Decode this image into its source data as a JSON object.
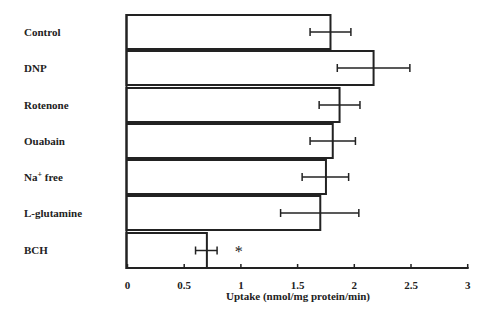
{
  "chart_data": {
    "type": "bar",
    "orientation": "horizontal",
    "title": "",
    "xlabel": "Uptake (nmol/mg protein/min)",
    "ylabel": "",
    "categories": [
      "Control",
      "DNP",
      "Rotenone",
      "Ouabain",
      "Na+ free",
      "L-glutamine",
      "BCH"
    ],
    "category_display": [
      {
        "main": "Control",
        "sup": ""
      },
      {
        "main": "DNP",
        "sup": ""
      },
      {
        "main": "Rotenone",
        "sup": ""
      },
      {
        "main": "Ouabain",
        "sup": ""
      },
      {
        "main": "Na",
        "sup": "+",
        "rest": " free"
      },
      {
        "main": "L-glutamine",
        "sup": ""
      },
      {
        "main": "BCH",
        "sup": ""
      }
    ],
    "values": [
      1.79,
      2.17,
      1.87,
      1.81,
      1.75,
      1.7,
      0.7
    ],
    "error_low": [
      1.61,
      1.85,
      1.69,
      1.61,
      1.54,
      1.35,
      0.6
    ],
    "error_high": [
      1.97,
      2.49,
      2.05,
      2.01,
      1.95,
      2.04,
      0.79
    ],
    "annotations": [
      {
        "category": "BCH",
        "text": "*",
        "x": 0.98
      }
    ],
    "xlim": [
      0,
      3
    ],
    "xticks": [
      0,
      0.5,
      1,
      1.5,
      2,
      2.5,
      3
    ],
    "xtick_labels": [
      "0",
      "0.5",
      "1",
      "1.5",
      "2",
      "2.5",
      "3"
    ],
    "grid": false,
    "legend": null,
    "colors": {
      "bar_fill": "#ffffff",
      "bar_stroke": "#222222",
      "axis": "#222222"
    }
  }
}
